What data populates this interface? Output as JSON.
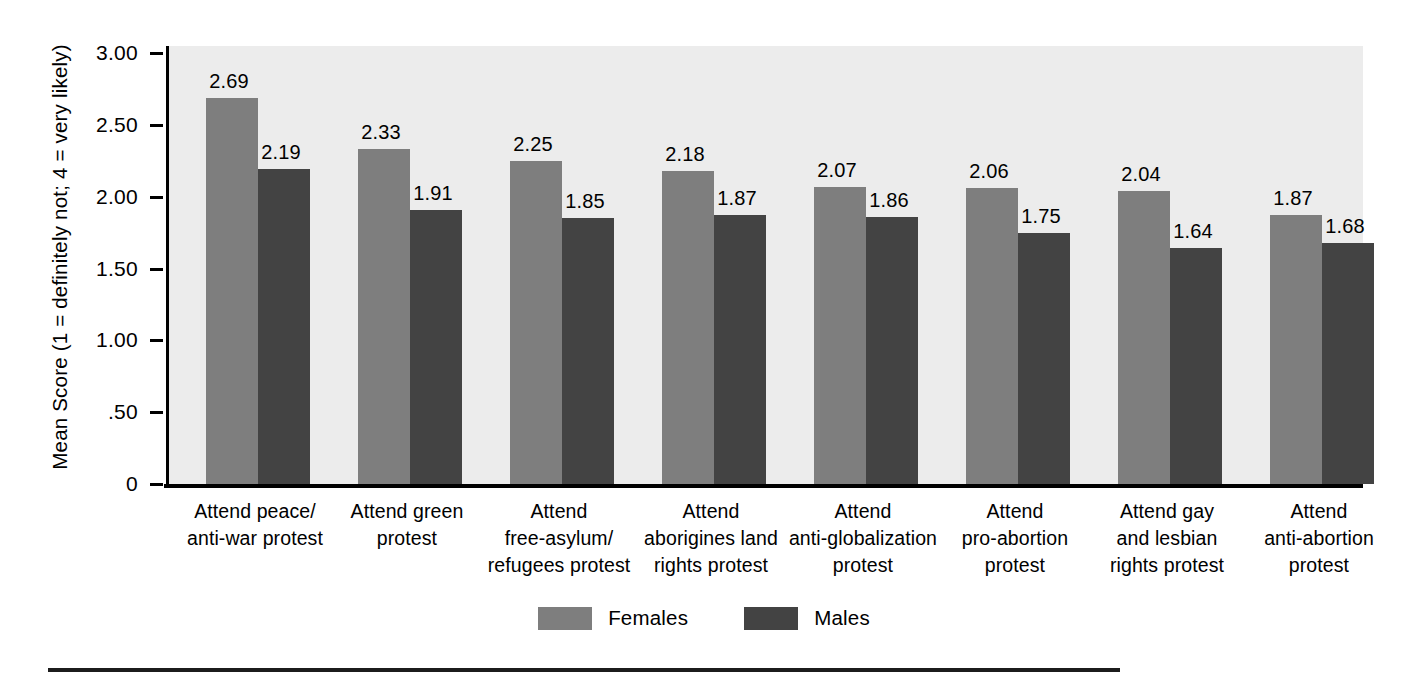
{
  "chart_data": {
    "type": "bar",
    "title": "",
    "xlabel": "",
    "ylabel": "Mean Score  (1 = definitely not; 4 = very likely)",
    "ylim": [
      0,
      3.0
    ],
    "yticks": [
      "0",
      ".50",
      "1.00",
      "1.50",
      "2.00",
      "2.50",
      "3.00"
    ],
    "ytick_values": [
      0,
      0.5,
      1.0,
      1.5,
      2.0,
      2.5,
      3.0
    ],
    "grid": false,
    "legend_position": "bottom-center",
    "categories": [
      "Attend peace/\nanti-war protest",
      "Attend green\nprotest",
      "Attend\nfree-asylum/\nrefugees protest",
      "Attend\naborigines land\nrights protest",
      "Attend\nanti-globalization\nprotest",
      "Attend\npro-abortion\nprotest",
      "Attend gay\nand lesbian\nrights protest",
      "Attend\nanti-abortion\nprotest"
    ],
    "category_lines": [
      [
        "Attend peace/",
        "anti-war protest"
      ],
      [
        "Attend green",
        "protest"
      ],
      [
        "Attend",
        "free-asylum/",
        "refugees protest"
      ],
      [
        "Attend",
        "aborigines land",
        "rights protest"
      ],
      [
        "Attend",
        "anti-globalization",
        "protest"
      ],
      [
        "Attend",
        "pro-abortion",
        "protest"
      ],
      [
        "Attend gay",
        "and lesbian",
        "rights protest"
      ],
      [
        "Attend",
        "anti-abortion",
        "protest"
      ]
    ],
    "series": [
      {
        "name": "Females",
        "color": "#7e7e7e",
        "values": [
          2.69,
          2.33,
          2.25,
          2.18,
          2.07,
          2.06,
          2.04,
          1.87
        ],
        "labels": [
          "2.69",
          "2.33",
          "2.25",
          "2.18",
          "2.07",
          "2.06",
          "2.04",
          "1.87"
        ]
      },
      {
        "name": "Males",
        "color": "#434343",
        "values": [
          2.19,
          1.91,
          1.85,
          1.87,
          1.86,
          1.75,
          1.64,
          1.68
        ],
        "labels": [
          "2.19",
          "1.91",
          "1.85",
          "1.87",
          "1.86",
          "1.75",
          "1.64",
          "1.68"
        ]
      }
    ]
  },
  "legend": {
    "items": [
      {
        "label": "Females",
        "color": "#7e7e7e"
      },
      {
        "label": "Males",
        "color": "#434343"
      }
    ]
  },
  "colors": {
    "females": "#7e7e7e",
    "males": "#434343",
    "plot_background": "#ececec",
    "axis": "#000000",
    "page_background": "#ffffff"
  }
}
